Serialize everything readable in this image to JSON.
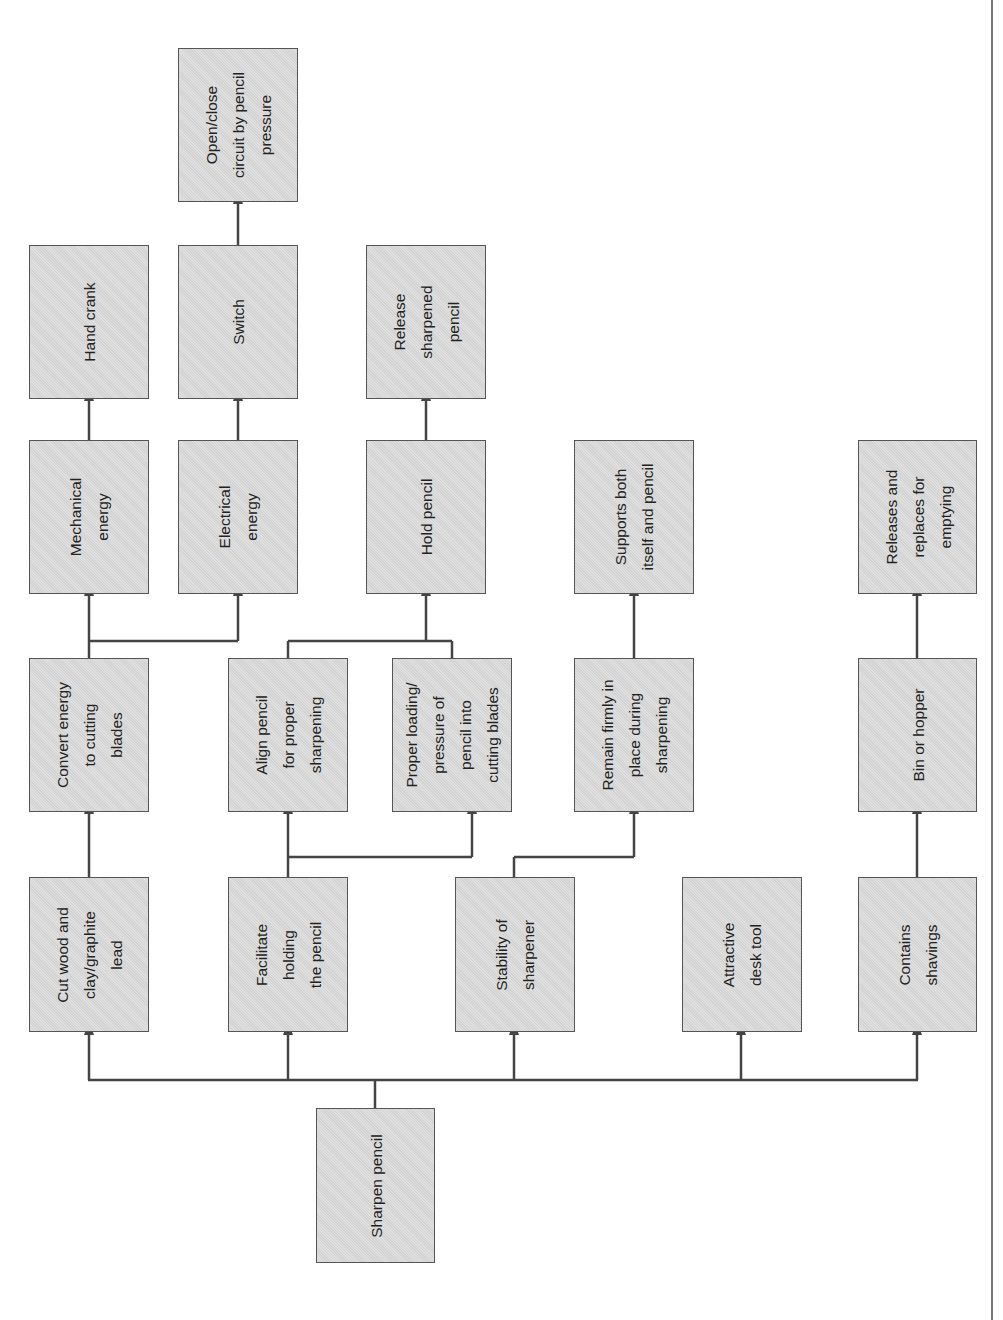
{
  "diagram": {
    "type": "function tree / functional decomposition",
    "orientation": "rotated 90 degrees counter-clockwise",
    "root": "Sharpen pencil",
    "boxes": {
      "sharpen_pencil": "Sharpen pencil",
      "cut_wood": "Cut wood and\nclay/graphite\nlead",
      "facilitate_holding": "Facilitate\nholding\nthe pencil",
      "stability": "Stability of\nsharpener",
      "attractive": "Attractive\ndesk tool",
      "contains_shavings": "Contains\nshavings",
      "convert_energy": "Convert energy\nto cutting\nblades",
      "align_pencil": "Align pencil\nfor proper\nsharpening",
      "proper_loading": "Proper loading/\npressure of\npencil into\ncutting blades",
      "remain_firmly": "Remain firmly in\nplace during\nsharpening",
      "bin_hopper": "Bin or hopper",
      "mechanical_energy": "Mechanical\nenergy",
      "electrical_energy": "Electrical\nenergy",
      "hold_pencil": "Hold pencil",
      "supports_both": "Supports both\nitself and pencil",
      "releases_replaces": "Releases and\nreplaces for\nemptying",
      "hand_crank": "Hand crank",
      "switch": "Switch",
      "release_sharpened": "Release\nsharpened\npencil",
      "open_close": "Open/close\ncircuit by pencil\npressure"
    },
    "edges": [
      [
        "Sharpen pencil",
        "Cut wood and clay/graphite lead"
      ],
      [
        "Sharpen pencil",
        "Facilitate holding the pencil"
      ],
      [
        "Sharpen pencil",
        "Stability of sharpener"
      ],
      [
        "Sharpen pencil",
        "Attractive desk tool"
      ],
      [
        "Sharpen pencil",
        "Contains shavings"
      ],
      [
        "Cut wood and clay/graphite lead",
        "Convert energy to cutting blades"
      ],
      [
        "Facilitate holding the pencil",
        "Align pencil for proper sharpening"
      ],
      [
        "Facilitate holding the pencil",
        "Proper loading/pressure of pencil into cutting blades"
      ],
      [
        "Stability of sharpener",
        "Remain firmly in place during sharpening"
      ],
      [
        "Contains shavings",
        "Bin or hopper"
      ],
      [
        "Convert energy to cutting blades",
        "Mechanical energy"
      ],
      [
        "Convert energy to cutting blades",
        "Electrical energy"
      ],
      [
        "Align pencil for proper sharpening",
        "Hold pencil"
      ],
      [
        "Proper loading/pressure of pencil into cutting blades",
        "Hold pencil"
      ],
      [
        "Remain firmly in place during sharpening",
        "Supports both itself and pencil"
      ],
      [
        "Bin or hopper",
        "Releases and replaces for emptying"
      ],
      [
        "Mechanical energy",
        "Hand crank"
      ],
      [
        "Electrical energy",
        "Switch"
      ],
      [
        "Hold pencil",
        "Release sharpened pencil"
      ],
      [
        "Switch",
        "Open/close circuit by pencil pressure"
      ]
    ],
    "colors": {
      "box_fill": "#d9d9d9",
      "box_border": "#555555",
      "line": "#444444",
      "text": "#222222"
    }
  }
}
